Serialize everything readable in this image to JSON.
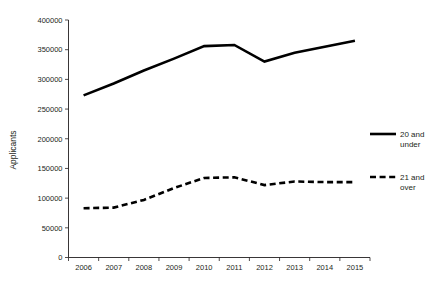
{
  "chart_data": {
    "type": "line",
    "title": "",
    "xlabel": "",
    "ylabel": "Applicants",
    "categories": [
      "2006",
      "2007",
      "2008",
      "2009",
      "2010",
      "2011",
      "2012",
      "2013",
      "2014",
      "2015"
    ],
    "ylim": [
      0,
      400000
    ],
    "ytick_labels": [
      "0",
      "50000",
      "100000",
      "150000",
      "200000",
      "250000",
      "300000",
      "350000",
      "400000"
    ],
    "ytick_values": [
      0,
      50000,
      100000,
      150000,
      200000,
      250000,
      300000,
      350000,
      400000
    ],
    "grid": false,
    "legend_position": "right",
    "series": [
      {
        "name": "20 and under",
        "style": "solid",
        "color": "#000000",
        "values": [
          273000,
          293000,
          315000,
          335000,
          356000,
          358000,
          330000,
          345000,
          355000,
          365000
        ]
      },
      {
        "name": "21 and over",
        "style": "dashed",
        "color": "#000000",
        "values": [
          83000,
          84000,
          97000,
          117000,
          134000,
          135000,
          122000,
          128000,
          127000,
          127000
        ]
      }
    ]
  },
  "legend": {
    "items": [
      {
        "label_line1": "20 and",
        "label_line2": "under",
        "style": "solid"
      },
      {
        "label_line1": "21 and",
        "label_line2": "over",
        "style": "dashed"
      }
    ]
  },
  "axis": {
    "y_title": "Applicants"
  }
}
